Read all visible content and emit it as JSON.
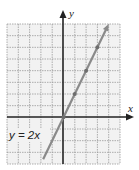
{
  "chart_data": {
    "type": "line",
    "title": "",
    "xlabel": "x",
    "ylabel": "y",
    "xlim": [
      -5,
      5
    ],
    "ylim": [
      -4,
      8
    ],
    "grid": true,
    "series": [
      {
        "name": "y = 2x",
        "equation": "y = 2x",
        "x": [
          -1.8,
          0,
          1,
          2,
          3,
          4
        ],
        "y": [
          -3.6,
          0,
          2,
          4,
          6,
          8
        ],
        "marked_points": [
          [
            0,
            0
          ],
          [
            1,
            2
          ],
          [
            2,
            4
          ],
          [
            3,
            6
          ]
        ]
      }
    ],
    "annotations": [
      {
        "text": "y = 2x",
        "near": [
          -2,
          -2
        ]
      }
    ]
  },
  "labels": {
    "x_axis": "x",
    "y_axis": "y",
    "equation": "y = 2x"
  },
  "colors": {
    "grid": "#9a9a9a",
    "grid_bg": "#f2f2f2",
    "axis": "#222222",
    "line": "#8a8a8a",
    "text": "#222222"
  }
}
